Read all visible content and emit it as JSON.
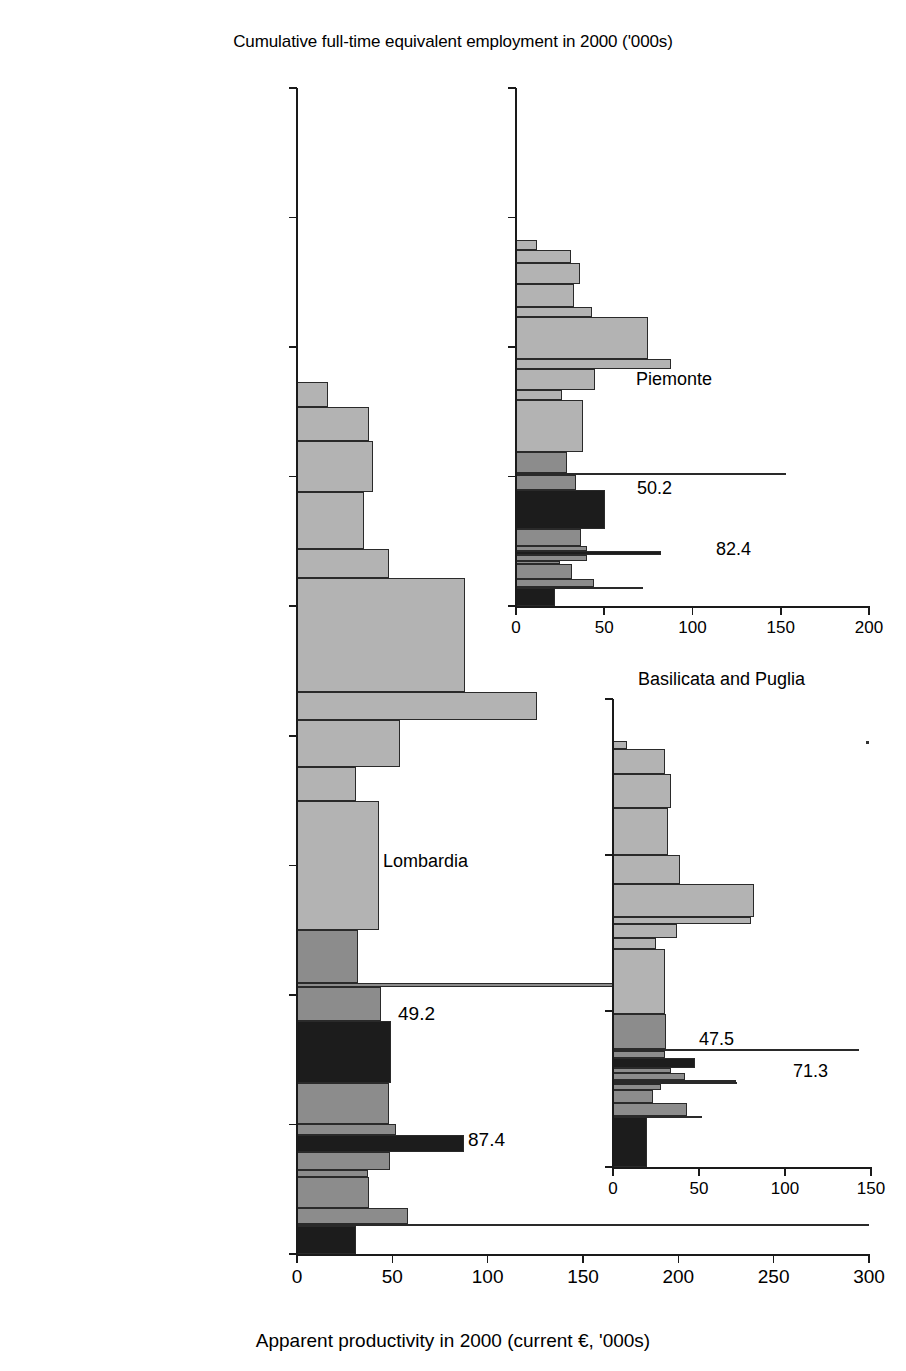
{
  "figure": {
    "top_title": "Cumulative full-time equivalent employment in 2000 ('000s)",
    "bottom_title": "Apparent productivity in 2000 (current €, '000s)"
  },
  "colors": {
    "light": "#b3b3b3",
    "mid": "#8c8c8c",
    "dark": "#1c1c1c",
    "outline": "#2a2a2a",
    "axis": "#1a1a1a",
    "background": "#ffffff"
  },
  "categories": [
    "Agriculture",
    "Mining, quarrying",
    "Food",
    "Textiles",
    "Leather",
    "Paper",
    "Chemicals",
    "Nonmetallic minerals",
    "Metals",
    "Equipment",
    "Wood, plastics",
    "Electricity, gas, water",
    "Construction",
    "Trade, repairs",
    "Hotels, restaurants",
    "Transport",
    "Finance",
    "Real estate",
    "Public administration",
    "Education",
    "Health",
    "Other community\nservices",
    "Domestic"
  ],
  "main_panel": {
    "name": "Lombardia",
    "y_ticks": [
      "0",
      "500",
      "1,000",
      "1,500",
      "2,000",
      "2,500",
      "3,000",
      "3,500",
      "4,000",
      "4,500"
    ],
    "x_ticks": [
      "0",
      "50",
      "100",
      "150",
      "200",
      "250",
      "300"
    ],
    "annotations": [
      {
        "text": "49.2",
        "value": 49.2,
        "category": "Equipment"
      },
      {
        "text": "87.4",
        "value": 87.4,
        "category": "Chemicals"
      }
    ]
  },
  "inset_piemonte": {
    "name": "Piemonte",
    "y_ticks": [
      "0",
      "500",
      "1,000",
      "1,500",
      "2,000"
    ],
    "x_ticks": [
      "0",
      "50",
      "100",
      "150",
      "200"
    ],
    "annotations": [
      {
        "text": "50.2",
        "value": 50.2,
        "category": "Equipment"
      },
      {
        "text": "82.4",
        "value": 82.4,
        "category": "Chemicals"
      }
    ]
  },
  "inset_basilicata": {
    "name": "Basilicata and Puglia",
    "y_ticks": [
      "0",
      "500",
      "1,000",
      "1,500"
    ],
    "x_ticks": [
      "0",
      "50",
      "100",
      "150"
    ],
    "annotations": [
      {
        "text": "47.5",
        "value": 47.5,
        "category": "Equipment"
      },
      {
        "text": "71.3",
        "value": 71.3,
        "category": "Chemicals"
      }
    ]
  },
  "chart_data": {
    "type": "bar",
    "xlabel": "Apparent productivity in 2000 (current €, '000s)",
    "ylabel": "Cumulative full-time equivalent employment in 2000 ('000s)",
    "grid": false,
    "legend": null,
    "shade_levels": {
      "dark": "manufacturing highlight sectors (Agriculture, Chemicals, Equipment)",
      "mid": "industry / construction sectors",
      "light": "services sectors"
    },
    "panels": [
      {
        "name": "Lombardia",
        "xlim": [
          0,
          300
        ],
        "ylim": [
          0,
          4500
        ],
        "xticks": [
          0,
          50,
          100,
          150,
          200,
          250,
          300
        ],
        "yticks": [
          0,
          500,
          1000,
          1500,
          2000,
          2500,
          3000,
          3500,
          4000,
          4500
        ],
        "bars": [
          {
            "category": "Agriculture",
            "productivity": 31.0,
            "employment": 107,
            "shade": "dark"
          },
          {
            "category": "Mining, quarrying",
            "productivity": 300.0,
            "employment": 8,
            "shade": "mid"
          },
          {
            "category": "Food",
            "productivity": 58.0,
            "employment": 63,
            "shade": "mid"
          },
          {
            "category": "Textiles",
            "productivity": 38.0,
            "employment": 120,
            "shade": "mid"
          },
          {
            "category": "Leather",
            "productivity": 37.0,
            "employment": 25,
            "shade": "mid"
          },
          {
            "category": "Paper",
            "productivity": 49.0,
            "employment": 70,
            "shade": "mid"
          },
          {
            "category": "Chemicals",
            "productivity": 87.4,
            "employment": 67,
            "shade": "dark"
          },
          {
            "category": "Nonmetallic minerals",
            "productivity": 52.0,
            "employment": 40,
            "shade": "mid"
          },
          {
            "category": "Metals",
            "productivity": 48.0,
            "employment": 160,
            "shade": "mid"
          },
          {
            "category": "Equipment",
            "productivity": 49.2,
            "employment": 240,
            "shade": "dark"
          },
          {
            "category": "Wood, plastics",
            "productivity": 44.0,
            "employment": 130,
            "shade": "mid"
          },
          {
            "category": "Electricity, gas, water",
            "productivity": 181.0,
            "employment": 14,
            "shade": "mid"
          },
          {
            "category": "Construction",
            "productivity": 32.0,
            "employment": 205,
            "shade": "mid"
          },
          {
            "category": "Trade, repairs",
            "productivity": 43.0,
            "employment": 500,
            "shade": "light"
          },
          {
            "category": "Hotels, restaurants",
            "productivity": 31.0,
            "employment": 130,
            "shade": "light"
          },
          {
            "category": "Transport",
            "productivity": 54.0,
            "employment": 180,
            "shade": "light"
          },
          {
            "category": "Finance",
            "productivity": 126.0,
            "employment": 110,
            "shade": "light"
          },
          {
            "category": "Real estate",
            "productivity": 88.0,
            "employment": 440,
            "shade": "light"
          },
          {
            "category": "Public administration",
            "productivity": 48.0,
            "employment": 110,
            "shade": "light"
          },
          {
            "category": "Education",
            "productivity": 35.0,
            "employment": 220,
            "shade": "light"
          },
          {
            "category": "Health",
            "productivity": 40.0,
            "employment": 200,
            "shade": "light"
          },
          {
            "category": "Other community services",
            "productivity": 38.0,
            "employment": 130,
            "shade": "light"
          },
          {
            "category": "Domestic",
            "productivity": 16.0,
            "employment": 95,
            "shade": "light"
          }
        ]
      },
      {
        "name": "Piemonte",
        "xlim": [
          0,
          200
        ],
        "ylim": [
          0,
          2000
        ],
        "xticks": [
          0,
          50,
          100,
          150,
          200
        ],
        "yticks": [
          0,
          500,
          1000,
          1500,
          2000
        ],
        "bars": [
          {
            "category": "Agriculture",
            "productivity": 22.0,
            "employment": 70,
            "shade": "dark"
          },
          {
            "category": "Mining, quarrying",
            "productivity": 72.0,
            "employment": 4,
            "shade": "mid"
          },
          {
            "category": "Food",
            "productivity": 44.0,
            "employment": 32,
            "shade": "mid"
          },
          {
            "category": "Textiles",
            "productivity": 32.0,
            "employment": 58,
            "shade": "mid"
          },
          {
            "category": "Leather",
            "productivity": 25.0,
            "employment": 8,
            "shade": "mid"
          },
          {
            "category": "Paper",
            "productivity": 40.0,
            "employment": 26,
            "shade": "mid"
          },
          {
            "category": "Chemicals",
            "productivity": 82.4,
            "employment": 14,
            "shade": "dark"
          },
          {
            "category": "Nonmetallic minerals",
            "productivity": 40.0,
            "employment": 18,
            "shade": "mid"
          },
          {
            "category": "Metals",
            "productivity": 37.0,
            "employment": 66,
            "shade": "mid"
          },
          {
            "category": "Equipment",
            "productivity": 50.2,
            "employment": 150,
            "shade": "dark"
          },
          {
            "category": "Wood, plastics",
            "productivity": 34.0,
            "employment": 60,
            "shade": "mid"
          },
          {
            "category": "Electricity, gas, water",
            "productivity": 153.0,
            "employment": 8,
            "shade": "mid"
          },
          {
            "category": "Construction",
            "productivity": 29.0,
            "employment": 80,
            "shade": "mid"
          },
          {
            "category": "Trade, repairs",
            "productivity": 38.0,
            "employment": 200,
            "shade": "light"
          },
          {
            "category": "Hotels, restaurants",
            "productivity": 26.0,
            "employment": 40,
            "shade": "light"
          },
          {
            "category": "Transport",
            "productivity": 45.0,
            "employment": 80,
            "shade": "light"
          },
          {
            "category": "Finance",
            "productivity": 88.0,
            "employment": 40,
            "shade": "light"
          },
          {
            "category": "Real estate",
            "productivity": 75.0,
            "employment": 160,
            "shade": "light"
          },
          {
            "category": "Public administration",
            "productivity": 43.0,
            "employment": 40,
            "shade": "light"
          },
          {
            "category": "Education",
            "productivity": 33.0,
            "employment": 90,
            "shade": "light"
          },
          {
            "category": "Health",
            "productivity": 36.0,
            "employment": 80,
            "shade": "light"
          },
          {
            "category": "Other community services",
            "productivity": 31.0,
            "employment": 50,
            "shade": "light"
          },
          {
            "category": "Domestic",
            "productivity": 12.0,
            "employment": 38,
            "shade": "light"
          }
        ]
      },
      {
        "name": "Basilicata and Puglia",
        "xlim": [
          0,
          150
        ],
        "ylim": [
          0,
          1500
        ],
        "xticks": [
          0,
          50,
          100,
          150
        ],
        "yticks": [
          0,
          500,
          1000,
          1500
        ],
        "bars": [
          {
            "category": "Agriculture",
            "productivity": 20.0,
            "employment": 160,
            "shade": "dark"
          },
          {
            "category": "Mining, quarrying",
            "productivity": 52.0,
            "employment": 5,
            "shade": "mid"
          },
          {
            "category": "Food",
            "productivity": 43.0,
            "employment": 40,
            "shade": "mid"
          },
          {
            "category": "Textiles",
            "productivity": 23.0,
            "employment": 42,
            "shade": "mid"
          },
          {
            "category": "Leather",
            "productivity": 28.0,
            "employment": 18,
            "shade": "mid"
          },
          {
            "category": "Paper",
            "productivity": 72.0,
            "employment": 8,
            "shade": "mid"
          },
          {
            "category": "Chemicals",
            "productivity": 71.3,
            "employment": 5,
            "shade": "dark"
          },
          {
            "category": "Nonmetallic minerals",
            "productivity": 42.0,
            "employment": 22,
            "shade": "mid"
          },
          {
            "category": "Metals",
            "productivity": 34.0,
            "employment": 18,
            "shade": "mid"
          },
          {
            "category": "Equipment",
            "productivity": 47.5,
            "employment": 32,
            "shade": "dark"
          },
          {
            "category": "Wood, plastics",
            "productivity": 30.0,
            "employment": 22,
            "shade": "mid"
          },
          {
            "category": "Electricity, gas, water",
            "productivity": 143.0,
            "employment": 7,
            "shade": "mid"
          },
          {
            "category": "Construction",
            "productivity": 31.0,
            "employment": 110,
            "shade": "mid"
          },
          {
            "category": "Trade, repairs",
            "productivity": 30.0,
            "employment": 210,
            "shade": "light"
          },
          {
            "category": "Hotels, restaurants",
            "productivity": 25.0,
            "employment": 35,
            "shade": "light"
          },
          {
            "category": "Transport",
            "productivity": 37.0,
            "employment": 45,
            "shade": "light"
          },
          {
            "category": "Finance",
            "productivity": 80.0,
            "employment": 22,
            "shade": "light"
          },
          {
            "category": "Real estate",
            "productivity": 82.0,
            "employment": 105,
            "shade": "light"
          },
          {
            "category": "Public administration",
            "productivity": 39.0,
            "employment": 95,
            "shade": "light"
          },
          {
            "category": "Education",
            "productivity": 32.0,
            "employment": 150,
            "shade": "light"
          },
          {
            "category": "Health",
            "productivity": 34.0,
            "employment": 110,
            "shade": "light"
          },
          {
            "category": "Other community services",
            "productivity": 30.0,
            "employment": 80,
            "shade": "light"
          },
          {
            "category": "Domestic",
            "productivity": 8.0,
            "employment": 25,
            "shade": "light"
          }
        ]
      }
    ]
  }
}
